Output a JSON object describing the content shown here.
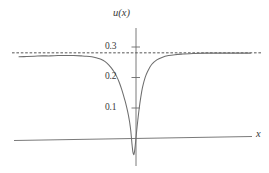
{
  "figure": {
    "background": "#ffffff",
    "curve_color": "#6e6e6e",
    "axis_color": "#6b6b6b",
    "asymptote_color": "#555555",
    "text_color": "#3a3a3a"
  },
  "axes": {
    "y_title": "u(x)",
    "x_title": "x",
    "y_ticks": [
      {
        "label": "0.1",
        "value": 0.1
      },
      {
        "label": "0.2",
        "value": 0.2
      },
      {
        "label": "0.3",
        "value": 0.3
      }
    ],
    "x_ticks": []
  },
  "chart_data": {
    "type": "line",
    "title": "",
    "xlabel": "x",
    "ylabel": "u(x)",
    "xlim": [
      -4.5,
      4.4
    ],
    "ylim": [
      -0.075,
      0.345
    ],
    "grid": false,
    "legend": null,
    "annotations": [
      {
        "text": "u(x)",
        "kind": "y-axis-label"
      },
      {
        "text": "x",
        "kind": "x-axis-label"
      }
    ],
    "series": [
      {
        "name": "u(x)",
        "style": "solid",
        "color": "#6e6e6e",
        "description": "Smooth profile approaching asymptote 0.28 at both tails with a deep narrow negative spike near x=-0.2 reaching about -0.05",
        "x": [
          -4.5,
          -4.2,
          -3.9,
          -3.6,
          -3.3,
          -3.0,
          -2.7,
          -2.4,
          -2.1,
          -1.9,
          -1.7,
          -1.5,
          -1.35,
          -1.2,
          -1.05,
          -0.95,
          -0.85,
          -0.75,
          -0.65,
          -0.55,
          -0.48,
          -0.42,
          -0.36,
          -0.32,
          -0.28,
          -0.25,
          -0.22,
          -0.2,
          -0.18,
          -0.15,
          -0.12,
          -0.09,
          -0.06,
          -0.03,
          0.0,
          0.03,
          0.07,
          0.12,
          0.18,
          0.25,
          0.35,
          0.45,
          0.6,
          0.8,
          1.0,
          1.25,
          1.5,
          1.8,
          2.2,
          2.7,
          3.2,
          3.7,
          4.4
        ],
        "y": [
          0.268,
          0.269,
          0.27,
          0.271,
          0.271,
          0.272,
          0.272,
          0.272,
          0.271,
          0.27,
          0.268,
          0.264,
          0.26,
          0.253,
          0.242,
          0.232,
          0.22,
          0.205,
          0.186,
          0.162,
          0.142,
          0.124,
          0.104,
          0.089,
          0.072,
          0.058,
          0.04,
          0.026,
          0.008,
          -0.02,
          -0.042,
          -0.051,
          -0.043,
          -0.022,
          0.004,
          0.03,
          0.062,
          0.098,
          0.134,
          0.168,
          0.2,
          0.221,
          0.243,
          0.258,
          0.266,
          0.272,
          0.275,
          0.277,
          0.279,
          0.28,
          0.28,
          0.28,
          0.28
        ]
      },
      {
        "name": "asymptote",
        "style": "dashed",
        "color": "#555555",
        "description": "Horizontal dashed asymptote",
        "y_const": 0.281
      }
    ]
  }
}
